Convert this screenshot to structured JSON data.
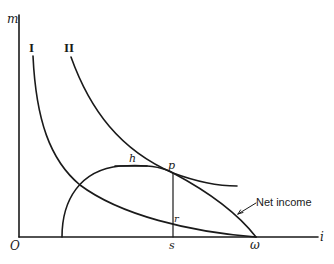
{
  "diagram": {
    "type": "economic-curve-diagram",
    "axes": {
      "y_label": "m",
      "x_label": "i",
      "origin_label": "O"
    },
    "curves": [
      {
        "id": "I",
        "label": "I"
      },
      {
        "id": "II",
        "label": "II"
      },
      {
        "id": "net-income",
        "label": "Net income"
      }
    ],
    "points": {
      "h": "h",
      "p": "p",
      "r": "r",
      "s": "s",
      "omega": "ω"
    }
  }
}
